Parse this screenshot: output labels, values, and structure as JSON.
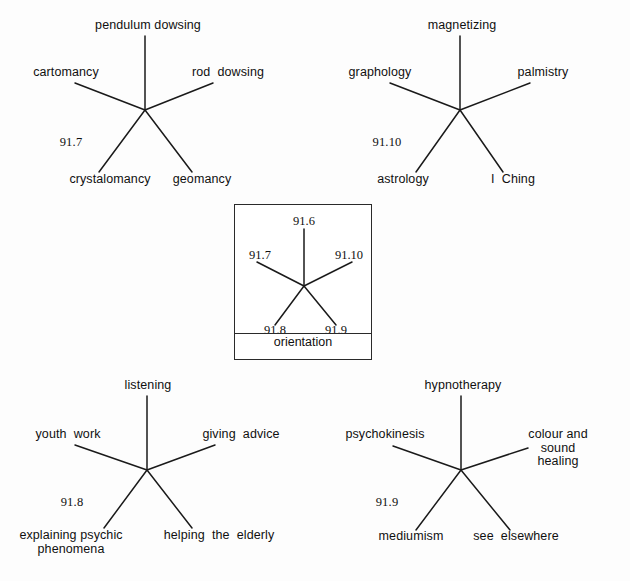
{
  "figure": {
    "type": "star-diagram-set",
    "background_color": "#fdfdfd",
    "line_color": "#1a1a1a",
    "text_color": "#101010"
  },
  "key": {
    "caption": "orientation",
    "spokes": [
      {
        "label": "91.6",
        "position": "top"
      },
      {
        "label": "91.7",
        "position": "upper-left"
      },
      {
        "label": "91.10",
        "position": "upper-right"
      },
      {
        "label": "91.8",
        "position": "lower-left"
      },
      {
        "label": "91.9",
        "position": "lower-right"
      }
    ]
  },
  "diagrams": [
    {
      "id": "diagram-91-7",
      "ref": "91.7",
      "position": "top-left",
      "spokes": [
        {
          "label": "pendulum dowsing",
          "direction": "top"
        },
        {
          "label": "cartomancy",
          "direction": "upper-left"
        },
        {
          "label": "rod  dowsing",
          "direction": "upper-right"
        },
        {
          "label": "crystalomancy",
          "direction": "lower-left"
        },
        {
          "label": "geomancy",
          "direction": "lower-right"
        }
      ]
    },
    {
      "id": "diagram-91-10",
      "ref": "91.10",
      "position": "top-right",
      "spokes": [
        {
          "label": "magnetizing",
          "direction": "top"
        },
        {
          "label": "graphology",
          "direction": "upper-left"
        },
        {
          "label": "palmistry",
          "direction": "upper-right"
        },
        {
          "label": "astrology",
          "direction": "lower-left"
        },
        {
          "label": "I  Ching",
          "direction": "lower-right"
        }
      ]
    },
    {
      "id": "diagram-91-8",
      "ref": "91.8",
      "position": "bottom-left",
      "spokes": [
        {
          "label": "listening",
          "direction": "top"
        },
        {
          "label": "youth  work",
          "direction": "upper-left"
        },
        {
          "label": "giving  advice",
          "direction": "upper-right"
        },
        {
          "label": "explaining  psychic\nphenomena",
          "direction": "lower-left"
        },
        {
          "label": "helping  the  elderly",
          "direction": "lower-right"
        }
      ]
    },
    {
      "id": "diagram-91-9",
      "ref": "91.9",
      "position": "bottom-right",
      "spokes": [
        {
          "label": "hypnotherapy",
          "direction": "top"
        },
        {
          "label": "psychokinesis",
          "direction": "upper-left"
        },
        {
          "label": "colour  and  sound\nhealing",
          "direction": "upper-right"
        },
        {
          "label": "mediumism",
          "direction": "lower-left"
        },
        {
          "label": "see  elsewhere",
          "direction": "lower-right"
        }
      ]
    }
  ]
}
